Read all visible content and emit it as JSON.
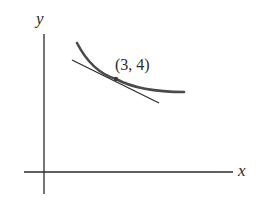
{
  "figure": {
    "axes": {
      "x_label": "x",
      "y_label": "y"
    },
    "point": {
      "label": "(3, 4)",
      "x": 3,
      "y": 4
    },
    "elements": [
      "x-axis",
      "y-axis",
      "curve",
      "tangent-line",
      "point-of-tangency"
    ],
    "colors": {
      "ink": "#2b2b2b",
      "curve": "#4a4a4a",
      "background": "#ffffff"
    }
  }
}
